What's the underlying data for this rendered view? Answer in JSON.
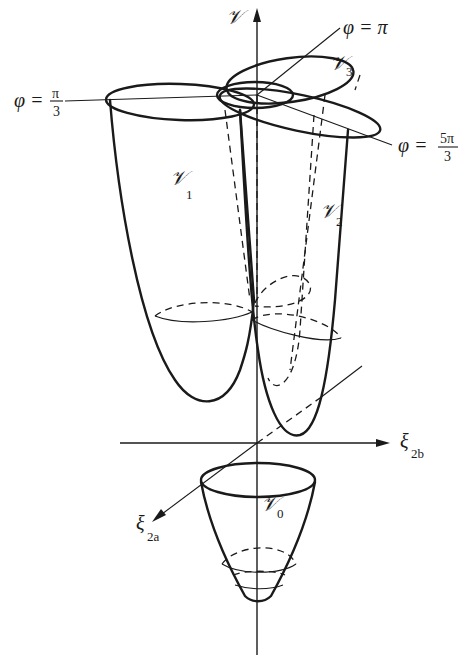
{
  "figure": {
    "axes": {
      "vertical": {
        "label": "𝒱"
      },
      "x_axis": {
        "label": "ξ",
        "subscript": "2b"
      },
      "y_axis": {
        "label": "ξ",
        "subscript": "2a"
      }
    },
    "surfaces": [
      {
        "id": "V0",
        "label": "𝒱",
        "subscript": "0"
      },
      {
        "id": "V1",
        "label": "𝒱",
        "subscript": "1"
      },
      {
        "id": "V2",
        "label": "𝒱",
        "subscript": "2"
      },
      {
        "id": "V3",
        "label": "𝒱",
        "subscript": "3"
      }
    ],
    "angles": [
      {
        "id": "phi_pi_3",
        "lhs": "φ =",
        "numerator": "π",
        "denominator": "3"
      },
      {
        "id": "phi_pi",
        "text": "φ = π"
      },
      {
        "id": "phi_5pi_3",
        "lhs": "φ =",
        "numerator": "5π",
        "denominator": "3"
      }
    ]
  }
}
